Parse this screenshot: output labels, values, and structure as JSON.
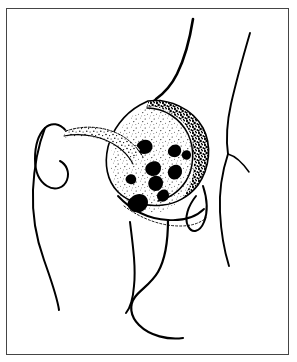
{
  "figure": {
    "kind": "anatomical-line-drawing",
    "title": "",
    "caption": "",
    "background_color": "#ffffff",
    "ink_color": "#000000",
    "frame": {
      "border_color": "#454545",
      "border_width_px": 1.5,
      "x": 6,
      "y": 8,
      "width": 283,
      "height": 347
    },
    "regions": [
      {
        "name": "superior-contour-left",
        "description": "long thick curve descending from top center toward lesion apex"
      },
      {
        "name": "superior-contour-right",
        "description": "slender curve descending from top right, branching near mid-right"
      },
      {
        "name": "trochanter-hook",
        "description": "hook / curl shape at left forming greater trochanter outline"
      },
      {
        "name": "femoral-shaft-left",
        "description": "long tapering curve down the left side"
      },
      {
        "name": "lesion-mass",
        "description": "rounded stippled mass with mottled rim and dark irregular blotches"
      },
      {
        "name": "inferior-wavy-contours",
        "description": "two wavy curves sweeping across the lower center"
      },
      {
        "name": "right-loop",
        "description": "narrow elongated loop below the lesion on the right"
      }
    ],
    "lesion": {
      "name": "lesion-mass",
      "rim_texture": "dense stipple / mottled",
      "interior_texture": "sparse stipple with dark blotches",
      "blotch_count": 9,
      "fill_color": "#ffffff",
      "stipple_color": "#000000"
    },
    "labels": [],
    "annotations": []
  }
}
